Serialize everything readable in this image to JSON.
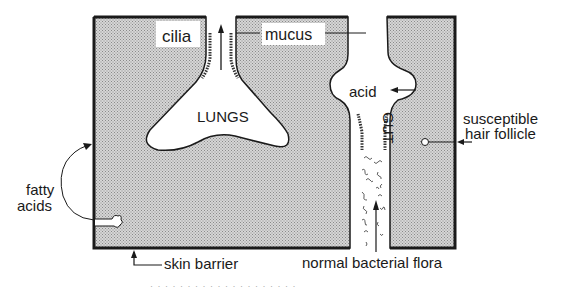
{
  "figure": {
    "colors": {
      "tissue_fill": "#c8c8c8",
      "outline": "#1a1a1a",
      "background": "#ffffff",
      "label_box": "#ffffff"
    },
    "labels": {
      "cilia": "cilia",
      "mucus": "mucus",
      "lungs": "LUNGS",
      "acid": "acid",
      "gut": "GUT",
      "susceptible_line1": "susceptible",
      "susceptible_line2": "hair follicle",
      "fatty_line1": "fatty",
      "fatty_line2": "acids",
      "skin_barrier": "skin barrier",
      "bacterial_flora": "normal bacterial flora"
    },
    "caption_fragment": "·   ·   ·   ·   ·  ·   · ·  ·  ·   ·   ·    ·   ·  ·   ·   ·  ·   ·  ·"
  }
}
